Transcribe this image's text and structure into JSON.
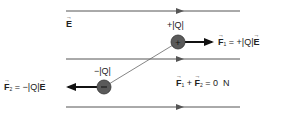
{
  "field": {
    "label": "E",
    "line_color": "#555555",
    "lines_y": [
      11,
      59,
      107
    ]
  },
  "positive_charge": {
    "label": "+|Q|",
    "sign": "+",
    "color": "#555555"
  },
  "negative_charge": {
    "label": "−|Q|",
    "sign": "−",
    "color": "#555555"
  },
  "force1": {
    "symbol": "F",
    "sub": "1",
    "eq": " = +|Q|",
    "field": "E"
  },
  "force2": {
    "symbol": "F",
    "sub": "2",
    "eq": " = −|Q|",
    "field": "E"
  },
  "sum": {
    "f1": "F",
    "f1_sub": "1",
    "plus": " + ",
    "f2": "F",
    "f2_sub": "2",
    "result": " = 0  N"
  }
}
